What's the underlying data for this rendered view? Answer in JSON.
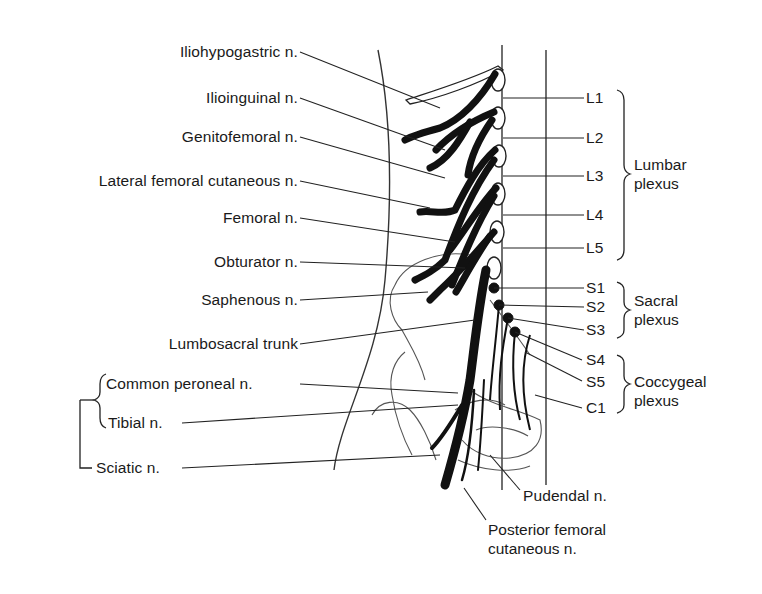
{
  "figure": {
    "colors": {
      "nerve": "#111111",
      "outline": "#222222",
      "background": "#ffffff"
    }
  },
  "left_labels": [
    {
      "id": "iliohypogastric",
      "text": "Iliohypogastric n."
    },
    {
      "id": "ilioinguinal",
      "text": "Ilioinguinal n."
    },
    {
      "id": "genitofemoral",
      "text": "Genitofemoral n."
    },
    {
      "id": "lateral-femoral-cutaneous",
      "text": "Lateral femoral cutaneous n."
    },
    {
      "id": "femoral",
      "text": "Femoral n."
    },
    {
      "id": "obturator",
      "text": "Obturator n."
    },
    {
      "id": "saphenous",
      "text": "Saphenous n."
    },
    {
      "id": "lumbosacral-trunk",
      "text": "Lumbosacral trunk"
    },
    {
      "id": "common-peroneal",
      "text": "Common peroneal n."
    },
    {
      "id": "tibial",
      "text": "Tibial n."
    },
    {
      "id": "sciatic",
      "text": "Sciatic n."
    }
  ],
  "bottom_labels": [
    {
      "id": "pudendal",
      "text": "Pudendal n."
    },
    {
      "id": "posterior-femoral-cutaneous",
      "line1": "Posterior femoral",
      "line2": "cutaneous n."
    }
  ],
  "roots": {
    "lumbar": [
      "L1",
      "L2",
      "L3",
      "L4",
      "L5"
    ],
    "sacral": [
      "S1",
      "S2",
      "S3"
    ],
    "coccygeal": [
      "S4",
      "S5",
      "C1"
    ]
  },
  "groups": {
    "lumbar": {
      "line1": "Lumbar",
      "line2": "plexus"
    },
    "sacral": {
      "line1": "Sacral",
      "line2": "plexus"
    },
    "coccygeal": {
      "line1": "Coccygeal",
      "line2": "plexus"
    }
  }
}
